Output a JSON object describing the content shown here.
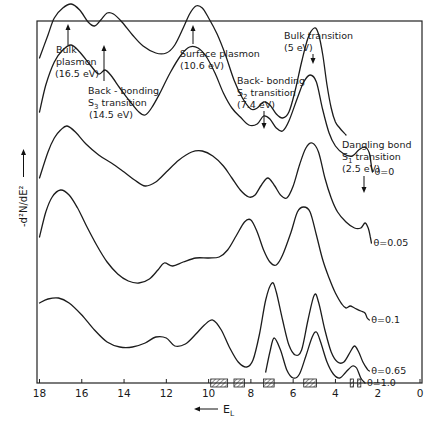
{
  "chart_data": {
    "type": "line",
    "title": "",
    "xlabel": "E_L",
    "xlabel_arrow": "←",
    "ylabel": "-d²N/dE²",
    "xlim": [
      18,
      0
    ],
    "x_reversed": true,
    "xticks": [
      18,
      16,
      14,
      12,
      10,
      8,
      6,
      4,
      2,
      0
    ],
    "xtick_labels": [
      "18",
      "16",
      "14",
      "12",
      "10",
      "8",
      "6",
      "4",
      "2",
      "0"
    ],
    "grid": false,
    "legend": "inline labels at right end of each curve",
    "series": [
      {
        "name": "top (annotated reference)",
        "label": "",
        "points": [
          [
            18,
            58
          ],
          [
            17.6,
            35
          ],
          [
            17.3,
            18
          ],
          [
            16.9,
            8
          ],
          [
            16.5,
            4
          ],
          [
            16.1,
            10
          ],
          [
            15.7,
            22
          ],
          [
            15.4,
            26
          ],
          [
            15.1,
            20
          ],
          [
            14.8,
            13
          ],
          [
            14.5,
            14
          ],
          [
            14.1,
            22
          ],
          [
            13.6,
            35
          ],
          [
            13.1,
            46
          ],
          [
            12.5,
            53
          ],
          [
            12,
            53
          ],
          [
            11.6,
            45
          ],
          [
            11.2,
            28
          ],
          [
            10.9,
            14
          ],
          [
            10.6,
            6
          ],
          [
            10.3,
            8
          ],
          [
            10.0,
            18
          ],
          [
            9.6,
            34
          ],
          [
            9.2,
            55
          ],
          [
            8.8,
            80
          ],
          [
            8.4,
            98
          ],
          [
            8.0,
            109
          ],
          [
            7.7,
            108
          ],
          [
            7.4,
            102
          ],
          [
            7.1,
            105
          ],
          [
            6.8,
            114
          ],
          [
            6.5,
            118
          ],
          [
            6.2,
            112
          ],
          [
            5.9,
            90
          ],
          [
            5.6,
            62
          ],
          [
            5.3,
            38
          ],
          [
            5.0,
            28
          ],
          [
            4.8,
            34
          ],
          [
            4.6,
            55
          ],
          [
            4.4,
            85
          ],
          [
            4.2,
            108
          ],
          [
            4.0,
            122
          ],
          [
            3.8,
            128
          ],
          [
            3.5,
            135
          ]
        ]
      },
      {
        "name": "θ=0",
        "label": "θ=0",
        "points": [
          [
            18,
            112
          ],
          [
            17.7,
            85
          ],
          [
            17.3,
            62
          ],
          [
            16.9,
            50
          ],
          [
            16.5,
            45
          ],
          [
            16.1,
            52
          ],
          [
            15.6,
            65
          ],
          [
            15.2,
            74
          ],
          [
            14.9,
            70
          ],
          [
            14.6,
            76
          ],
          [
            14.2,
            88
          ],
          [
            13.7,
            102
          ],
          [
            13.3,
            112
          ],
          [
            13.0,
            115
          ],
          [
            12.7,
            108
          ],
          [
            12.3,
            93
          ],
          [
            11.8,
            72
          ],
          [
            11.3,
            55
          ],
          [
            10.9,
            47
          ],
          [
            10.5,
            48
          ],
          [
            10.1,
            57
          ],
          [
            9.7,
            73
          ],
          [
            9.3,
            93
          ],
          [
            8.9,
            108
          ],
          [
            8.5,
            117
          ],
          [
            8.1,
            125
          ],
          [
            7.7,
            124
          ],
          [
            7.4,
            116
          ],
          [
            7.1,
            119
          ],
          [
            6.8,
            128
          ],
          [
            6.5,
            131
          ],
          [
            6.2,
            121
          ],
          [
            5.8,
            98
          ],
          [
            5.5,
            82
          ],
          [
            5.2,
            75
          ],
          [
            4.9,
            82
          ],
          [
            4.6,
            110
          ],
          [
            4.3,
            133
          ],
          [
            4.0,
            146
          ],
          [
            3.6,
            154
          ],
          [
            3.2,
            156
          ],
          [
            2.9,
            150
          ],
          [
            2.6,
            147
          ],
          [
            2.4,
            153
          ],
          [
            2.3,
            166
          ],
          [
            2.25,
            172
          ]
        ]
      },
      {
        "name": "θ=0.05",
        "label": "θ=0.05",
        "points": [
          [
            18,
            178
          ],
          [
            17.6,
            152
          ],
          [
            17.3,
            138
          ],
          [
            17.0,
            130
          ],
          [
            16.7,
            126
          ],
          [
            16.3,
            132
          ],
          [
            15.8,
            144
          ],
          [
            15.2,
            155
          ],
          [
            14.6,
            163
          ],
          [
            14.0,
            172
          ],
          [
            13.5,
            180
          ],
          [
            13.0,
            186
          ],
          [
            12.5,
            182
          ],
          [
            12.0,
            172
          ],
          [
            11.4,
            160
          ],
          [
            10.8,
            152
          ],
          [
            10.3,
            151
          ],
          [
            9.8,
            156
          ],
          [
            9.3,
            166
          ],
          [
            8.9,
            178
          ],
          [
            8.5,
            190
          ],
          [
            8.1,
            197
          ],
          [
            7.8,
            195
          ],
          [
            7.5,
            185
          ],
          [
            7.2,
            178
          ],
          [
            6.9,
            185
          ],
          [
            6.6,
            195
          ],
          [
            6.3,
            198
          ],
          [
            6.0,
            186
          ],
          [
            5.7,
            165
          ],
          [
            5.4,
            148
          ],
          [
            5.1,
            143
          ],
          [
            4.8,
            152
          ],
          [
            4.5,
            178
          ],
          [
            4.2,
            198
          ],
          [
            3.9,
            212
          ],
          [
            3.5,
            222
          ],
          [
            3.1,
            228
          ],
          [
            2.8,
            228
          ],
          [
            2.6,
            223
          ],
          [
            2.45,
            228
          ],
          [
            2.35,
            237
          ],
          [
            2.3,
            243
          ]
        ]
      },
      {
        "name": "θ=0.1",
        "label": "θ=0.1",
        "points": [
          [
            18,
            237
          ],
          [
            17.7,
            212
          ],
          [
            17.4,
            197
          ],
          [
            17.0,
            190
          ],
          [
            16.6,
            195
          ],
          [
            16.2,
            208
          ],
          [
            15.8,
            225
          ],
          [
            15.3,
            245
          ],
          [
            14.8,
            262
          ],
          [
            14.3,
            274
          ],
          [
            13.8,
            281
          ],
          [
            13.3,
            283
          ],
          [
            12.8,
            279
          ],
          [
            12.4,
            270
          ],
          [
            12.1,
            263
          ],
          [
            11.7,
            266
          ],
          [
            11.2,
            262
          ],
          [
            10.6,
            258
          ],
          [
            10.0,
            258
          ],
          [
            9.5,
            257
          ],
          [
            9.1,
            250
          ],
          [
            8.7,
            236
          ],
          [
            8.3,
            222
          ],
          [
            8.0,
            220
          ],
          [
            7.7,
            232
          ],
          [
            7.4,
            250
          ],
          [
            7.1,
            262
          ],
          [
            6.8,
            265
          ],
          [
            6.5,
            255
          ],
          [
            6.1,
            232
          ],
          [
            5.8,
            212
          ],
          [
            5.5,
            207
          ],
          [
            5.2,
            212
          ],
          [
            4.9,
            235
          ],
          [
            4.6,
            260
          ],
          [
            4.3,
            278
          ],
          [
            4.0,
            293
          ],
          [
            3.7,
            304
          ],
          [
            3.5,
            308
          ],
          [
            3.3,
            306
          ],
          [
            3.1,
            308
          ],
          [
            2.8,
            311
          ],
          [
            2.6,
            313
          ],
          [
            2.5,
            318
          ],
          [
            2.4,
            320
          ]
        ]
      },
      {
        "name": "θ=0.65",
        "label": "θ=0.65",
        "points": [
          [
            18,
            303
          ],
          [
            17.6,
            299
          ],
          [
            17.1,
            298
          ],
          [
            16.6,
            303
          ],
          [
            16.0,
            315
          ],
          [
            15.4,
            330
          ],
          [
            14.8,
            342
          ],
          [
            14.2,
            347
          ],
          [
            13.6,
            347
          ],
          [
            13.0,
            343
          ],
          [
            12.5,
            337
          ],
          [
            12.0,
            338
          ],
          [
            11.6,
            346
          ],
          [
            11.1,
            344
          ],
          [
            10.6,
            334
          ],
          [
            10.2,
            325
          ],
          [
            9.8,
            320
          ],
          [
            9.4,
            330
          ],
          [
            9.0,
            348
          ],
          [
            8.6,
            362
          ],
          [
            8.2,
            367
          ],
          [
            7.9,
            360
          ],
          [
            7.6,
            335
          ],
          [
            7.3,
            300
          ],
          [
            7.0,
            283
          ],
          [
            6.8,
            292
          ],
          [
            6.5,
            320
          ],
          [
            6.2,
            345
          ],
          [
            5.9,
            355
          ],
          [
            5.6,
            350
          ],
          [
            5.3,
            320
          ],
          [
            5.0,
            295
          ],
          [
            4.8,
            302
          ],
          [
            4.5,
            330
          ],
          [
            4.2,
            352
          ],
          [
            3.9,
            362
          ],
          [
            3.6,
            362
          ],
          [
            3.3,
            352
          ],
          [
            3.1,
            346
          ],
          [
            2.9,
            352
          ],
          [
            2.7,
            362
          ],
          [
            2.5,
            369
          ],
          [
            2.4,
            371
          ]
        ]
      },
      {
        "name": "θ=1.0",
        "label": "θ=1.0",
        "points": [
          [
            7.3,
            372
          ],
          [
            7.1,
            352
          ],
          [
            6.9,
            338
          ],
          [
            6.6,
            350
          ],
          [
            6.3,
            370
          ],
          [
            6.0,
            378
          ],
          [
            5.7,
            374
          ],
          [
            5.4,
            356
          ],
          [
            5.1,
            337
          ],
          [
            4.9,
            332
          ],
          [
            4.7,
            342
          ],
          [
            4.4,
            362
          ],
          [
            4.1,
            374
          ],
          [
            3.8,
            378
          ],
          [
            3.5,
            372
          ],
          [
            3.2,
            366
          ],
          [
            3.0,
            368
          ],
          [
            2.8,
            378
          ],
          [
            2.6,
            383
          ]
        ]
      }
    ],
    "annotations": [
      {
        "text": [
          "Bulk",
          "plasmon",
          "(16.5 eV)"
        ],
        "x_ev": 16.5,
        "feature": "Bulk plasmon"
      },
      {
        "text": [
          "Back - bonding",
          "S₃ transition",
          "(14.5 eV)"
        ],
        "x_ev": 14.5,
        "feature": "Back-bonding S3 transition"
      },
      {
        "text": [
          "Surface  plasmon",
          "(10.6  eV)"
        ],
        "x_ev": 10.6,
        "feature": "Surface plasmon"
      },
      {
        "text": [
          "Back- bonding",
          "S₂ transition",
          "(7.4  eV)"
        ],
        "x_ev": 7.4,
        "feature": "Back-bonding S2 transition"
      },
      {
        "text": [
          "Bulk  transition",
          "(5  eV)"
        ],
        "x_ev": 5.0,
        "feature": "Bulk transition"
      },
      {
        "text": [
          "Dangling  bond",
          "S₁ transition",
          "(2.5  eV)"
        ],
        "x_ev": 2.5,
        "feature": "Dangling bond S1 transition"
      }
    ],
    "hatched_regions_ev": [
      [
        9.9,
        9.1
      ],
      [
        8.8,
        8.3
      ],
      [
        7.4,
        6.9
      ],
      [
        5.5,
        4.9
      ],
      [
        3.3,
        3.15
      ],
      [
        2.95,
        2.8
      ]
    ]
  },
  "labels": {
    "ylabel": "-d²N/dE²",
    "xlabel": "E",
    "xlabel_sub": "L",
    "xlabel_arrow": "←——"
  }
}
